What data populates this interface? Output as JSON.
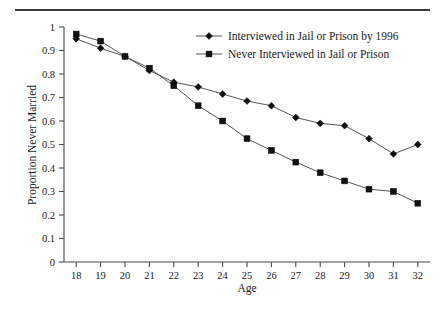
{
  "chart_data": {
    "type": "line",
    "title": "",
    "xlabel": "Age",
    "ylabel": "Proportion Never Married",
    "x": [
      18,
      19,
      20,
      21,
      22,
      23,
      24,
      25,
      26,
      27,
      28,
      29,
      30,
      31,
      32
    ],
    "categories": [
      "18",
      "19",
      "20",
      "21",
      "22",
      "23",
      "24",
      "25",
      "26",
      "27",
      "28",
      "29",
      "30",
      "31",
      "32"
    ],
    "xlim": [
      17.5,
      32.5
    ],
    "ylim": [
      0,
      1
    ],
    "grid": false,
    "legend_position": "top-right",
    "series": [
      {
        "name": "Interviewed in Jail or Prison by 1996",
        "marker": "diamond",
        "values": [
          0.95,
          0.91,
          0.875,
          0.815,
          0.765,
          0.745,
          0.715,
          0.685,
          0.665,
          0.615,
          0.59,
          0.58,
          0.525,
          0.46,
          0.5
        ]
      },
      {
        "name": "Never Interviewed in Jail or Prison",
        "marker": "square",
        "values": [
          0.97,
          0.94,
          0.875,
          0.825,
          0.75,
          0.665,
          0.6,
          0.525,
          0.475,
          0.425,
          0.38,
          0.345,
          0.31,
          0.3,
          0.25
        ]
      }
    ],
    "xticks": [
      "18",
      "19",
      "20",
      "21",
      "22",
      "23",
      "24",
      "25",
      "26",
      "27",
      "28",
      "29",
      "30",
      "31",
      "32"
    ],
    "yticks": [
      "0",
      "0.1",
      "0.2",
      "0.3",
      "0.4",
      "0.5",
      "0.6",
      "0.7",
      "0.8",
      "0.9",
      "1"
    ],
    "ytick_values": [
      0,
      0.1,
      0.2,
      0.3,
      0.4,
      0.5,
      0.6,
      0.7,
      0.8,
      0.9,
      1
    ]
  },
  "colors": {
    "axis": "#4a4a4a",
    "line": "#555555",
    "marker": "#101010",
    "rule": "#3a3a3a",
    "background": "#ffffff"
  }
}
